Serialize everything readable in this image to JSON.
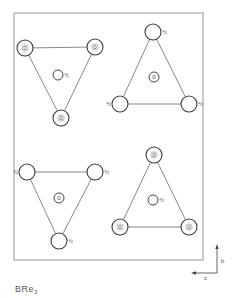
{
  "figure": {
    "title": "BRe",
    "title_subscript": "3",
    "axes": {
      "vertical_label": "b",
      "horizontal_label": "c"
    }
  },
  "colors": {
    "ink": "#444444",
    "frame": "#8a8a8a",
    "background": "#ffffff"
  },
  "frame": {
    "x": 14,
    "y": 13,
    "width": 189,
    "height": 247
  },
  "triangles": [
    {
      "name": "top-left",
      "vertices": [
        {
          "x": 25,
          "y": 48,
          "height": "0",
          "label_pos": "inside"
        },
        {
          "x": 95,
          "y": 47,
          "height": "0",
          "label_pos": "inside"
        },
        {
          "x": 61,
          "y": 118,
          "height": "0",
          "label_pos": "inside"
        }
      ],
      "center": {
        "x": 58,
        "y": 75,
        "height": "½",
        "label_pos": "right"
      }
    },
    {
      "name": "top-right",
      "vertices": [
        {
          "x": 153,
          "y": 32,
          "height": "½",
          "label_pos": "right"
        },
        {
          "x": 120,
          "y": 104,
          "height": "½",
          "label_pos": "left"
        },
        {
          "x": 189,
          "y": 104,
          "height": "½",
          "label_pos": "right"
        }
      ],
      "center": {
        "x": 154,
        "y": 77,
        "height": "0",
        "label_pos": "inside"
      }
    },
    {
      "name": "bottom-left",
      "vertices": [
        {
          "x": 27,
          "y": 172,
          "height": "½",
          "label_pos": "left"
        },
        {
          "x": 95,
          "y": 172,
          "height": "½",
          "label_pos": "right"
        },
        {
          "x": 59,
          "y": 241,
          "height": "½",
          "label_pos": "right"
        }
      ],
      "center": {
        "x": 59,
        "y": 198,
        "height": "0",
        "label_pos": "inside"
      }
    },
    {
      "name": "bottom-right",
      "vertices": [
        {
          "x": 154,
          "y": 155,
          "height": "0",
          "label_pos": "inside"
        },
        {
          "x": 120,
          "y": 227,
          "height": "0",
          "label_pos": "inside"
        },
        {
          "x": 189,
          "y": 227,
          "height": "0",
          "label_pos": "inside"
        }
      ],
      "center": {
        "x": 153,
        "y": 200,
        "height": "½",
        "label_pos": "right"
      }
    }
  ]
}
